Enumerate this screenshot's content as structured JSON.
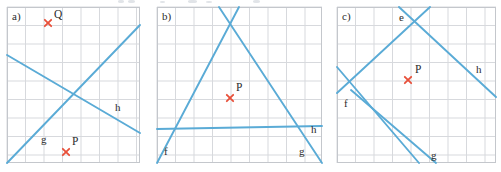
{
  "figure": {
    "panel_count": 3,
    "colors": {
      "line": "#5aabd6",
      "line_dark": "#4a9ec9",
      "grid": "#d7d9dd",
      "grid_border": "#c4c7cc",
      "marker": "#e8503a",
      "label_text": "#2b2b2b",
      "background": "#ffffff"
    },
    "grid": {
      "cell_px": 18.5,
      "stroke_width": 1
    }
  },
  "panels": [
    {
      "id": "panel-a",
      "label": "a)",
      "bounds": {
        "x": 7,
        "y": 7,
        "width": 133,
        "height": 156
      },
      "grid": {
        "cols": 7,
        "rows": 8
      },
      "lines": [
        {
          "name": "g",
          "label": "g",
          "label_x": 34,
          "label_y": 136,
          "x1": 0,
          "y1": 156,
          "x2": 133,
          "y2": 18
        },
        {
          "name": "h",
          "label": "h",
          "label_x": 108,
          "label_y": 104,
          "x1": 0,
          "y1": 48,
          "x2": 133,
          "y2": 126
        }
      ],
      "points": [
        {
          "name": "Q",
          "label": "Q",
          "x": 41,
          "y": 16,
          "label_dx": 6,
          "label_dy": -5
        },
        {
          "name": "P",
          "label": "P",
          "x": 59,
          "y": 145,
          "label_dx": 6,
          "label_dy": -7
        }
      ]
    },
    {
      "id": "panel-b",
      "label": "b)",
      "bounds": {
        "x": 157,
        "y": 7,
        "width": 165,
        "height": 156
      },
      "grid": {
        "cols": 9,
        "rows": 8
      },
      "lines": [
        {
          "name": "f",
          "label": "f",
          "label_x": 7,
          "label_y": 148,
          "x1": 0,
          "y1": 156,
          "x2": 82,
          "y2": 0
        },
        {
          "name": "g",
          "label": "g",
          "label_x": 142,
          "label_y": 148,
          "x1": 62,
          "y1": 0,
          "x2": 165,
          "y2": 156
        },
        {
          "name": "h",
          "label": "h",
          "label_x": 154,
          "label_y": 126,
          "x1": 0,
          "y1": 122,
          "x2": 165,
          "y2": 119
        }
      ],
      "points": [
        {
          "name": "P",
          "label": "P",
          "x": 73,
          "y": 91,
          "label_dx": 6,
          "label_dy": -7
        }
      ]
    },
    {
      "id": "panel-c",
      "label": "c)",
      "bounds": {
        "x": 337,
        "y": 7,
        "width": 159,
        "height": 156
      },
      "grid": {
        "cols": 9,
        "rows": 8
      },
      "lines": [
        {
          "name": "e",
          "label": "e",
          "label_x": 62,
          "label_y": 14,
          "x1": 14,
          "y1": 83,
          "x2": 99,
          "y2": 156
        },
        {
          "name": "f",
          "label": "f",
          "label_x": 7,
          "label_y": 100,
          "x1": 0,
          "y1": 60,
          "x2": 82,
          "y2": 156
        },
        {
          "name": "g",
          "label": "g",
          "label_x": 94,
          "label_y": 152,
          "x1": 0,
          "y1": 86,
          "x2": 93,
          "y2": 0
        },
        {
          "name": "h",
          "label": "h",
          "label_x": 139,
          "label_y": 66,
          "x1": 62,
          "y1": 0,
          "x2": 159,
          "y2": 90
        }
      ],
      "points": [
        {
          "name": "P",
          "label": "P",
          "x": 71,
          "y": 73,
          "label_dx": 7,
          "label_dy": -7
        }
      ]
    }
  ]
}
